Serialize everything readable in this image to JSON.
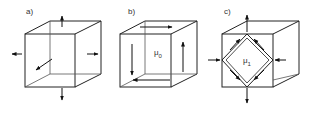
{
  "panels": [
    {
      "id": "a",
      "label": "a)"
    },
    {
      "id": "b",
      "label": "b)",
      "symbol": "μ",
      "subscript": "0"
    },
    {
      "id": "c",
      "label": "c)",
      "symbol": "μ",
      "subscript": "1"
    }
  ],
  "colors": {
    "stroke": "#222222",
    "background": "#ffffff"
  }
}
